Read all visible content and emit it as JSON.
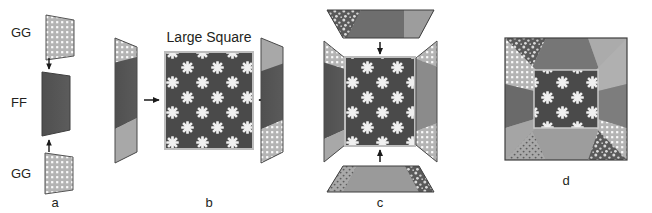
{
  "figure": {
    "type": "quilt-block-construction-diagram",
    "background_color": "#ffffff",
    "text_color": "#231f20",
    "width": 652,
    "height": 213
  },
  "palette": {
    "fabric_ff_dark": "#4a4a4a",
    "fabric_gg_light": "#b9b9b9",
    "fabric_gg_dot": "#ffffff",
    "fabric_plain_light": "#a8a8a8",
    "fabric_mid_gray": "#8e8e8e",
    "fabric_speckle_dark": "#515151",
    "center_bg": "#4a4a4a",
    "star_color": "#f2f2f2",
    "outline": "#3a3a3a",
    "arrow_color": "#1a1a1a"
  },
  "panels": [
    {
      "id": "a",
      "label": "a",
      "caption": "",
      "pieces": [
        {
          "name": "gg-top",
          "label": "GG",
          "fabric": "dotted-light"
        },
        {
          "name": "ff-middle",
          "label": "FF",
          "fabric": "solid-dark"
        },
        {
          "name": "gg-bottom",
          "label": "GG",
          "fabric": "dotted-light"
        }
      ],
      "arrows": [
        {
          "name": "arrow-down-top",
          "direction": "down"
        },
        {
          "name": "arrow-up-bottom",
          "direction": "up"
        }
      ]
    },
    {
      "id": "b",
      "label": "b",
      "caption": "Large Square",
      "pieces": [
        {
          "name": "left-strip",
          "fabric": "pieced-gg-ff-plain"
        },
        {
          "name": "center-square",
          "fabric": "star-print-dark"
        },
        {
          "name": "right-strip",
          "fabric": "pieced-plain-ff-gg"
        }
      ],
      "arrows": [
        {
          "name": "arrow-right",
          "direction": "right"
        },
        {
          "name": "arrow-left",
          "direction": "left"
        }
      ]
    },
    {
      "id": "c",
      "label": "c",
      "caption": "",
      "pieces": [
        {
          "name": "top-trapezoid",
          "fabric": "pieced-speckle-dark-plain"
        },
        {
          "name": "center-unit",
          "fabric": "star-print-with-side-strips"
        },
        {
          "name": "bottom-trapezoid",
          "fabric": "pieced-dot-plain-speckle"
        }
      ],
      "arrows": [
        {
          "name": "arrow-down",
          "direction": "down"
        },
        {
          "name": "arrow-up",
          "direction": "up"
        }
      ]
    },
    {
      "id": "d",
      "label": "d",
      "caption": "",
      "pieces": [
        {
          "name": "completed-block",
          "fabric": "assembled-square-in-square"
        }
      ],
      "arrows": []
    }
  ],
  "labels": {
    "gg": "GG",
    "ff": "FF",
    "large_square": "Large Square",
    "panel_a": "a",
    "panel_b": "b",
    "panel_c": "c",
    "panel_d": "d"
  }
}
